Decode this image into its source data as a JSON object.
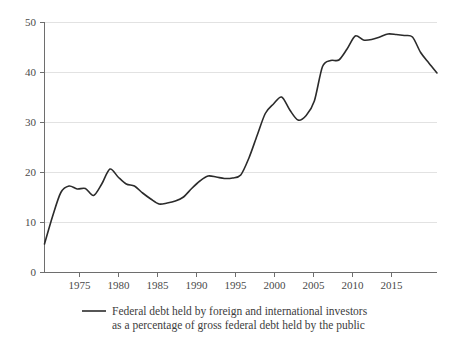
{
  "chart_data": {
    "type": "line",
    "title": "",
    "subtitle": "",
    "xlabel": "",
    "ylabel": "",
    "xlim": [
      1970,
      2018
    ],
    "ylim": [
      0,
      50
    ],
    "grid": "horizontal",
    "legend_position": "bottom",
    "y_ticks": [
      "0",
      "10",
      "20",
      "30",
      "40",
      "50"
    ],
    "y_tick_values": [
      0,
      10,
      20,
      30,
      40,
      50
    ],
    "x_ticks": [
      "1975",
      "1980",
      "1985",
      "1990",
      "1995",
      "2000",
      "2005",
      "2010",
      "2015"
    ],
    "x_tick_values": [
      1975,
      1980,
      1985,
      1990,
      1995,
      2000,
      2005,
      2010,
      2015
    ],
    "series": [
      {
        "name": "Federal debt held by foreign and international investors as a percentage of gross federal debt held by the public",
        "color": "#2b2b2b",
        "x": [
          1970,
          1971,
          1972,
          1973,
          1974,
          1975,
          1976,
          1977,
          1978,
          1979,
          1980,
          1981,
          1982,
          1983,
          1984,
          1985,
          1986,
          1987,
          1988,
          1989,
          1990,
          1991,
          1992,
          1993,
          1994,
          1995,
          1996,
          1997,
          1998,
          1999,
          2000,
          2001,
          2002,
          2003,
          2004,
          2005,
          2006,
          2007,
          2008,
          2009,
          2010,
          2011,
          2012,
          2013,
          2014,
          2015,
          2016,
          2017,
          2018
        ],
        "y": [
          5.6,
          11.2,
          15.9,
          17.2,
          16.6,
          16.7,
          15.3,
          17.6,
          20.6,
          19.0,
          17.6,
          17.2,
          15.8,
          14.6,
          13.6,
          13.8,
          14.2,
          15.0,
          16.7,
          18.2,
          19.2,
          19.0,
          18.7,
          18.8,
          19.4,
          22.8,
          27.3,
          31.7,
          33.6,
          35.0,
          32.4,
          30.4,
          31.3,
          34.2,
          41.1,
          42.3,
          42.4,
          44.6,
          47.2,
          46.4,
          46.5,
          47.0,
          47.6,
          47.5,
          47.3,
          47.0,
          43.9,
          41.8,
          39.8
        ]
      }
    ],
    "legend": [
      {
        "label_line1": "Federal debt held by foreign and international investors",
        "label_line2": "as a percentage of gross federal debt held by the public",
        "color": "#2b2b2b"
      }
    ]
  },
  "colors": {
    "series_line": "#2b2b2b",
    "gridline": "#e2e2e2",
    "axis": "#6e6e6e",
    "text": "#3d3d3d",
    "background": "#ffffff"
  }
}
